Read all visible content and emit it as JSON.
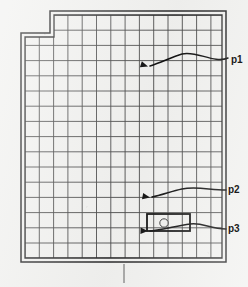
{
  "document": {
    "kind": "floor-plan-drawing",
    "background_color": "#f2f2f0",
    "ink_color": "#2b2b2b"
  },
  "plan": {
    "outline_name": "building-outline",
    "wall_style": "double-line",
    "outer_polygon": [
      [
        21,
        33
      ],
      [
        50,
        33
      ],
      [
        50,
        11
      ],
      [
        226,
        11
      ],
      [
        226,
        262
      ],
      [
        21,
        262
      ]
    ],
    "inner_polygon": [
      [
        25,
        37
      ],
      [
        54,
        37
      ],
      [
        54,
        15
      ],
      [
        222,
        15
      ],
      [
        222,
        258
      ],
      [
        25,
        258
      ]
    ],
    "notch": {
      "name": "top-left-notch",
      "x": 21,
      "y": 11,
      "width": 29,
      "height": 22
    }
  },
  "grid": {
    "name": "structural-grid",
    "origin_x": 25,
    "origin_y": 15,
    "right_x": 222,
    "bottom_y": 258,
    "notch_step_x": 54,
    "notch_step_y": 37,
    "cell_width": 14.3,
    "cell_height": 15.2,
    "columns": 14,
    "rows": 16,
    "line_color": "#4a4a4a",
    "line_width": 0.9
  },
  "highlight": {
    "name": "highlighted-cell",
    "x": 147,
    "y": 214,
    "width": 43,
    "height": 17,
    "stroke_color": "#111111",
    "stroke_width": 1.8,
    "marker": {
      "name": "circle-marker",
      "cx": 164,
      "cy": 223,
      "r": 4.2
    }
  },
  "annotations": [
    {
      "id": "p1",
      "label": "p1",
      "label_x": 231,
      "label_y": 55,
      "arrow_name": "callout-arrow-p1",
      "path": "M 228 58 C 214 64, 196 50, 182 54 C 172 57, 162 62, 150 66",
      "tip_x": 148,
      "tip_y": 66.5,
      "tip_angle": 162
    },
    {
      "id": "p2",
      "label": "p2",
      "label_x": 228,
      "label_y": 185,
      "arrow_name": "callout-arrow-p2",
      "path": "M 226 190 C 210 190, 196 186, 182 189 C 172 191, 162 195, 152 197",
      "tip_x": 150,
      "tip_y": 197.5,
      "tip_angle": 170
    },
    {
      "id": "p3",
      "label": "p3",
      "label_x": 228,
      "label_y": 224,
      "arrow_name": "callout-arrow-p3",
      "path": "M 226 229 C 210 229, 202 222, 190 224 C 176 226, 162 230, 150 231",
      "tip_x": 148,
      "tip_y": 231,
      "tip_angle": 178
    }
  ],
  "bottom_tick": {
    "name": "bottom-center-tick",
    "x": 124,
    "y_top": 264,
    "y_bottom": 283,
    "color": "#6d6d6d"
  }
}
